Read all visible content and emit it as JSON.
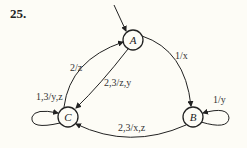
{
  "problem_number": "25.",
  "diagram": {
    "type": "finite-state-machine",
    "start_state": "A",
    "states": [
      {
        "id": "A",
        "label": "A",
        "x": 133,
        "y": 40
      },
      {
        "id": "B",
        "label": "B",
        "x": 193,
        "y": 117
      },
      {
        "id": "C",
        "label": "C",
        "x": 68,
        "y": 117
      }
    ],
    "transitions": [
      {
        "from": "A",
        "to": "B",
        "label": "1/x"
      },
      {
        "from": "A",
        "to": "C",
        "label": "2,3/z,y"
      },
      {
        "from": "C",
        "to": "A",
        "label": "2/z"
      },
      {
        "from": "C",
        "to": "C",
        "label": "1,3/y,z"
      },
      {
        "from": "B",
        "to": "B",
        "label": "1/y"
      },
      {
        "from": "B",
        "to": "C",
        "label": "2,3/x,z"
      }
    ]
  },
  "labels": {
    "A": "A",
    "B": "B",
    "C": "C",
    "a_to_b": "1/x",
    "a_to_c": "2,3/z,y",
    "c_to_a": "2/z",
    "c_loop": "1,3/y,z",
    "b_loop": "1/y",
    "b_to_c": "2,3/x,z"
  }
}
